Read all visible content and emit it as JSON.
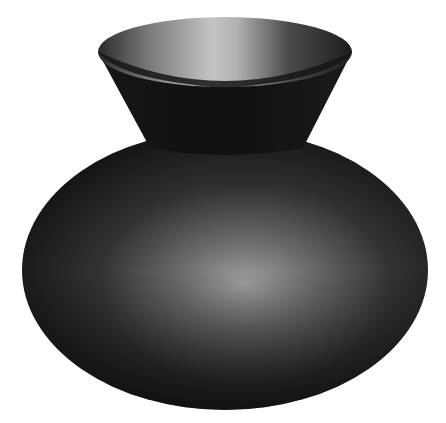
{
  "image": {
    "subject": "3D rendered vase",
    "background": "#ffffff",
    "colors": {
      "body_dark": "#141414",
      "body_mid": "#3a3a3a",
      "body_highlight": "#9a9a9a",
      "neck_dark": "#111111",
      "rim_inner_light": "#bdbdbd",
      "rim_inner_dark": "#2a2a2a"
    }
  }
}
